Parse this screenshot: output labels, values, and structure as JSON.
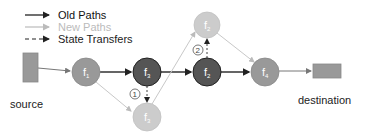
{
  "legend": {
    "items": [
      {
        "label": "Old Paths",
        "color": "#111111",
        "style": "solid"
      },
      {
        "label": "New Paths",
        "color": "#bbbbbb",
        "style": "solid"
      },
      {
        "label": "State Transfers",
        "color": "#222222",
        "style": "dashed"
      }
    ]
  },
  "endpoints": {
    "source": {
      "label": "source",
      "color": "#999999"
    },
    "destination": {
      "label": "destination",
      "color": "#999999"
    }
  },
  "nodes": {
    "f1": {
      "name": "f",
      "sub": "1",
      "color": "#999999"
    },
    "f3_old": {
      "name": "f",
      "sub": "3",
      "color": "#555555"
    },
    "f3_new": {
      "name": "f",
      "sub": "3",
      "color": "#cccccc"
    },
    "f2_old": {
      "name": "f",
      "sub": "2",
      "color": "#555555"
    },
    "f2_new": {
      "name": "f",
      "sub": "2",
      "color": "#cccccc"
    },
    "f4": {
      "name": "f",
      "sub": "4",
      "color": "#999999"
    }
  },
  "steps": {
    "step1": "1",
    "step2": "2"
  }
}
